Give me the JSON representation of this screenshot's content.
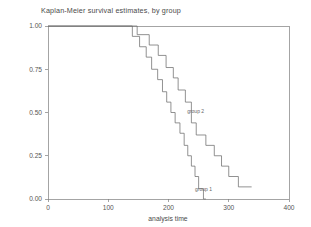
{
  "chart_data": {
    "type": "line",
    "title": "Kaplan-Meier survival estimates, by group",
    "xlabel": "analysis time",
    "ylabel": "",
    "xlim": [
      0,
      400
    ],
    "ylim": [
      0,
      1.0
    ],
    "grid": false,
    "legend_position": "inline-annotation",
    "xticks": [
      0,
      100,
      200,
      300,
      400
    ],
    "xtick_labels": [
      "0",
      "100",
      "200",
      "300",
      "400"
    ],
    "yticks": [
      0.0,
      0.25,
      0.5,
      0.75,
      1.0
    ],
    "ytick_labels": [
      "0.00",
      "0.25",
      "0.50",
      "0.75",
      "1.00"
    ],
    "series": [
      {
        "name": "group 1",
        "label": "group 1",
        "color": "#6e6e6e",
        "annotation": {
          "text": "group 1",
          "x": 258,
          "y": 0.045
        },
        "step": "post",
        "points": [
          [
            0,
            1.0
          ],
          [
            140,
            1.0
          ],
          [
            140,
            0.94
          ],
          [
            152,
            0.94
          ],
          [
            152,
            0.88
          ],
          [
            163,
            0.88
          ],
          [
            163,
            0.82
          ],
          [
            172,
            0.82
          ],
          [
            172,
            0.75
          ],
          [
            182,
            0.75
          ],
          [
            182,
            0.69
          ],
          [
            190,
            0.69
          ],
          [
            190,
            0.62
          ],
          [
            197,
            0.62
          ],
          [
            197,
            0.56
          ],
          [
            204,
            0.56
          ],
          [
            204,
            0.5
          ],
          [
            211,
            0.5
          ],
          [
            211,
            0.44
          ],
          [
            219,
            0.44
          ],
          [
            219,
            0.38
          ],
          [
            226,
            0.38
          ],
          [
            226,
            0.31
          ],
          [
            232,
            0.31
          ],
          [
            232,
            0.25
          ],
          [
            238,
            0.25
          ],
          [
            238,
            0.19
          ],
          [
            244,
            0.19
          ],
          [
            244,
            0.13
          ],
          [
            250,
            0.13
          ],
          [
            250,
            0.06
          ],
          [
            258,
            0.06
          ],
          [
            258,
            0.0
          ],
          [
            262,
            0.0
          ]
        ]
      },
      {
        "name": "group 2",
        "label": "group 2",
        "color": "#6e6e6e",
        "annotation": {
          "text": "group 2",
          "x": 245,
          "y": 0.5
        },
        "step": "post",
        "points": [
          [
            0,
            1.0
          ],
          [
            148,
            1.0
          ],
          [
            148,
            0.95
          ],
          [
            168,
            0.95
          ],
          [
            168,
            0.89
          ],
          [
            183,
            0.89
          ],
          [
            183,
            0.83
          ],
          [
            196,
            0.83
          ],
          [
            196,
            0.76
          ],
          [
            208,
            0.76
          ],
          [
            208,
            0.7
          ],
          [
            216,
            0.7
          ],
          [
            216,
            0.63
          ],
          [
            228,
            0.63
          ],
          [
            228,
            0.56
          ],
          [
            238,
            0.56
          ],
          [
            238,
            0.44
          ],
          [
            246,
            0.44
          ],
          [
            246,
            0.37
          ],
          [
            262,
            0.37
          ],
          [
            262,
            0.31
          ],
          [
            276,
            0.31
          ],
          [
            276,
            0.25
          ],
          [
            288,
            0.25
          ],
          [
            288,
            0.19
          ],
          [
            300,
            0.19
          ],
          [
            300,
            0.13
          ],
          [
            316,
            0.13
          ],
          [
            316,
            0.07
          ],
          [
            338,
            0.07
          ]
        ]
      }
    ]
  },
  "style": {
    "frame_color": "#7d7d7d",
    "text_color": "#4a4a4a",
    "background": "#ffffff"
  }
}
